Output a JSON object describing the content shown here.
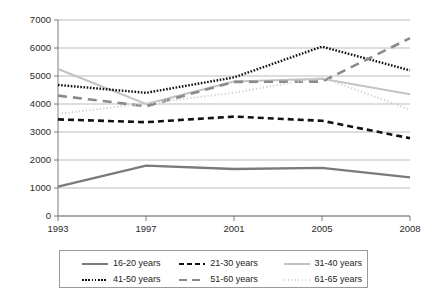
{
  "chart_data": {
    "type": "line",
    "title": "",
    "xlabel": "",
    "ylabel": "",
    "x": [
      "1993",
      "1997",
      "2001",
      "2005",
      "2008"
    ],
    "categories": [
      "1993",
      "1997",
      "2001",
      "2005",
      "2008"
    ],
    "ylim": [
      0,
      7000
    ],
    "ytick_values": [
      "0",
      "1000",
      "2000",
      "3000",
      "4000",
      "5000",
      "6000",
      "7000"
    ],
    "grid": true,
    "legend_position": "bottom",
    "series": [
      {
        "name": "16-20 years",
        "values": [
          1050,
          1800,
          1680,
          1720,
          1380
        ],
        "color": "#7a7a7a",
        "style": "solid",
        "width": 2.4
      },
      {
        "name": "21-30 years",
        "values": [
          3450,
          3350,
          3550,
          3400,
          2780
        ],
        "color": "#121212",
        "style": "dashed",
        "width": 2.6
      },
      {
        "name": "31-40 years",
        "values": [
          5250,
          4000,
          4800,
          4900,
          4350
        ],
        "color": "#c3c3c3",
        "style": "solid",
        "width": 2.0
      },
      {
        "name": "41-50 years",
        "values": [
          4680,
          4400,
          4950,
          6050,
          5200
        ],
        "color": "#121212",
        "style": "dotted",
        "width": 2.4
      },
      {
        "name": "51-60 years",
        "values": [
          4300,
          3920,
          4790,
          4800,
          6350
        ],
        "color": "#8a8a8a",
        "style": "dashed-long",
        "width": 2.6
      },
      {
        "name": "61-65 years",
        "values": [
          3650,
          4020,
          4400,
          4950,
          3800
        ],
        "color": "#d2d2d2",
        "style": "fine-dotted",
        "width": 2.0
      }
    ]
  },
  "legend": {
    "rows": [
      [
        {
          "label": "16-20 years",
          "series_index": 0
        },
        {
          "label": "21-30 years",
          "series_index": 1
        },
        {
          "label": "31-40 years",
          "series_index": 2
        }
      ],
      [
        {
          "label": "41-50 years",
          "series_index": 3
        },
        {
          "label": "51-60 years",
          "series_index": 4
        },
        {
          "label": "61-65 years",
          "series_index": 5
        }
      ]
    ]
  }
}
